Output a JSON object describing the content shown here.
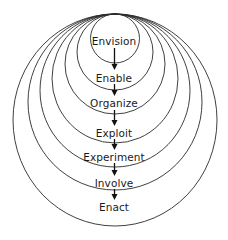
{
  "diagram": {
    "type": "nested-circles-process",
    "colors": {
      "stroke": "#2a2a2a",
      "text": "#1a1a1a",
      "background": "#ffffff"
    },
    "stages": [
      {
        "label": "Envision",
        "center_y": 41
      },
      {
        "label": "Enable",
        "center_y": 78
      },
      {
        "label": "Organize",
        "center_y": 103
      },
      {
        "label": "Exploit",
        "center_y": 133
      },
      {
        "label": "Experiment",
        "center_y": 157
      },
      {
        "label": "Involve",
        "center_y": 183
      },
      {
        "label": "Enact",
        "center_y": 207
      }
    ],
    "flow": "Envision → Enable → Organize → Exploit → Experiment → Involve → Enact"
  }
}
